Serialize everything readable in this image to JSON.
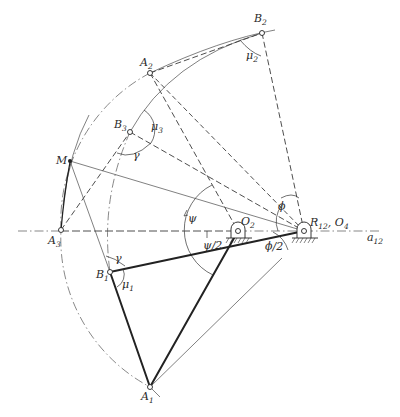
{
  "figure": {
    "colors": {
      "ink": "#222222",
      "background": "#ffffff"
    }
  },
  "points": {
    "A1": {
      "label": "A",
      "sub": "1",
      "x": 150,
      "y": 387
    },
    "A2": {
      "label": "A",
      "sub": "2",
      "x": 150,
      "y": 73
    },
    "A3": {
      "label": "A",
      "sub": "3",
      "x": 61,
      "y": 230
    },
    "B1": {
      "label": "B",
      "sub": "1",
      "x": 110,
      "y": 272
    },
    "B2": {
      "label": "B",
      "sub": "2",
      "x": 262,
      "y": 33
    },
    "B3": {
      "label": "B",
      "sub": "3",
      "x": 130,
      "y": 132
    },
    "M": {
      "label": "M",
      "x": 70,
      "y": 161
    },
    "O2": {
      "label": "O",
      "sub": "2",
      "x": 238,
      "y": 231
    },
    "R12_O4": {
      "label_r": "R",
      "sub_r": "12",
      "sep": ", ",
      "label_o": "O",
      "sub_o": "4",
      "x": 304,
      "y": 231
    }
  },
  "axis": {
    "label": "a",
    "sub": "12"
  },
  "angles": {
    "mu1": {
      "label": "μ",
      "sub": "1"
    },
    "mu2": {
      "label": "μ",
      "sub": "2"
    },
    "mu3": {
      "label": "μ",
      "sub": "3"
    },
    "gamma_top": {
      "label": "γ"
    },
    "gamma_bottom": {
      "label": "γ"
    },
    "psi": {
      "label": "ψ"
    },
    "psi_half": {
      "label": "ψ/2"
    },
    "phi": {
      "label": "ϕ"
    },
    "phi_half": {
      "label": "ϕ/2"
    }
  }
}
